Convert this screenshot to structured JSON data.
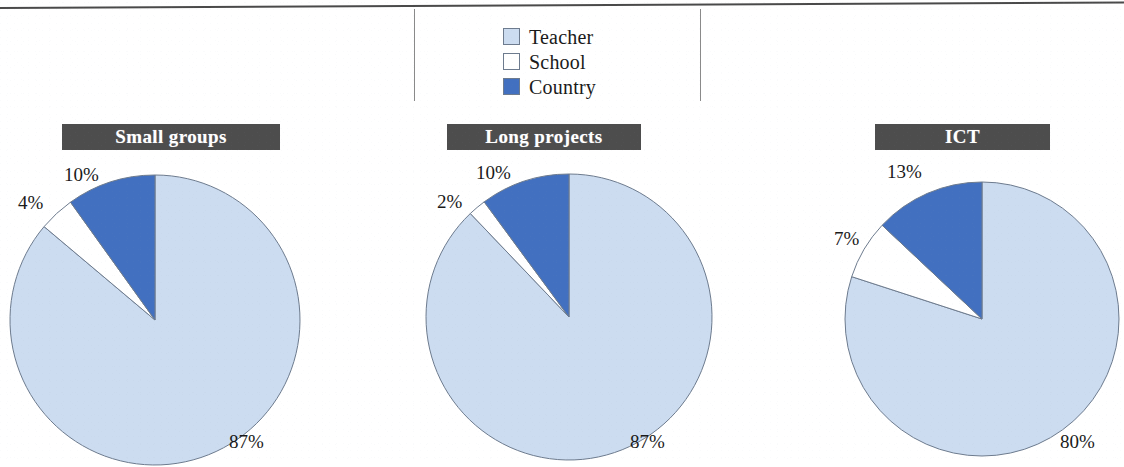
{
  "figure": {
    "legend": {
      "items": [
        {
          "label": "Teacher",
          "color": "#ccdcf0",
          "icon": "square-swatch-icon"
        },
        {
          "label": "School",
          "color": "#ffffff",
          "icon": "square-swatch-icon"
        },
        {
          "label": "Country",
          "color": "#4270c0",
          "icon": "square-swatch-icon"
        }
      ]
    },
    "panels": [
      {
        "title": "Small groups",
        "labels": {
          "teacher": "87%",
          "school": "4%",
          "country": "10%"
        }
      },
      {
        "title": "Long projects",
        "labels": {
          "teacher": "87%",
          "school": "2%",
          "country": "10%"
        }
      },
      {
        "title": "ICT",
        "labels": {
          "teacher": "80%",
          "school": "7%",
          "country": "13%"
        }
      }
    ]
  },
  "chart_data": [
    {
      "type": "pie",
      "title": "Small groups",
      "categories": [
        "Teacher",
        "School",
        "Country"
      ],
      "values": [
        87,
        4,
        10
      ],
      "data_labels": [
        "87%",
        "4%",
        "10%"
      ],
      "colors": [
        "#ccdcf0",
        "#ffffff",
        "#4270c0"
      ],
      "start_angle_deg": 0,
      "direction": "clockwise",
      "legend_position": "top-center",
      "grid": false,
      "xlabel": "",
      "ylabel": ""
    },
    {
      "type": "pie",
      "title": "Long projects",
      "categories": [
        "Teacher",
        "School",
        "Country"
      ],
      "values": [
        87,
        2,
        10
      ],
      "data_labels": [
        "87%",
        "2%",
        "10%"
      ],
      "colors": [
        "#ccdcf0",
        "#ffffff",
        "#4270c0"
      ],
      "start_angle_deg": 0,
      "direction": "clockwise",
      "legend_position": "top-center",
      "grid": false,
      "xlabel": "",
      "ylabel": ""
    },
    {
      "type": "pie",
      "title": "ICT",
      "categories": [
        "Teacher",
        "School",
        "Country"
      ],
      "values": [
        80,
        7,
        13
      ],
      "data_labels": [
        "80%",
        "7%",
        "13%"
      ],
      "colors": [
        "#ccdcf0",
        "#ffffff",
        "#4270c0"
      ],
      "start_angle_deg": 0,
      "direction": "clockwise",
      "legend_position": "top-center",
      "grid": false,
      "xlabel": "",
      "ylabel": ""
    }
  ]
}
